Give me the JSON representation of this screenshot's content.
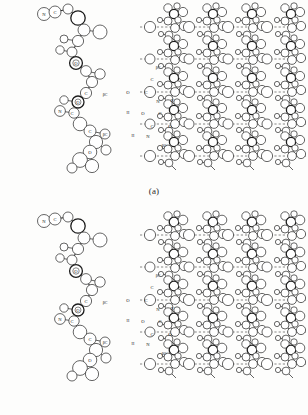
{
  "figure": {
    "type": "molecular-structure-diagram",
    "rendering": "black-and-white scanned line drawing, ball-and-stick / space-filling hybrid",
    "panels": [
      {
        "id": "a",
        "caption": "(a)",
        "left_view": {
          "name": "single-chain",
          "description": "isolated zig-zag polypeptide chain viewed edge-on"
        },
        "right_view": {
          "name": "sheet-lattice",
          "description": "extended hydrogen-bonded sheet, four chains wide",
          "chain_count": 4,
          "repeat_rows": 5
        },
        "atom_labels": [
          "N",
          "C",
          "O",
          "H",
          "βC"
        ]
      },
      {
        "id": "b",
        "caption": "(b)",
        "left_view": {
          "name": "single-chain",
          "description": "isolated zig-zag polypeptide chain viewed edge-on"
        },
        "right_view": {
          "name": "sheet-lattice",
          "description": "extended hydrogen-bonded sheet, four chains wide",
          "chain_count": 4,
          "repeat_rows": 5
        },
        "atom_labels": [
          "N",
          "C",
          "O",
          "H",
          "βC"
        ]
      }
    ],
    "labels": {
      "nitrogen": "N",
      "carbon": "C",
      "oxygen": "O",
      "hydrogen": "H",
      "beta_carbon": "βC"
    },
    "colors": {
      "background": "#fdfdfc",
      "bond": "#3a3a3a",
      "atom_outline": "#333333",
      "atom_fill": "#ffffff",
      "hydrogen_bond": "#555555",
      "text": "#141414"
    }
  }
}
